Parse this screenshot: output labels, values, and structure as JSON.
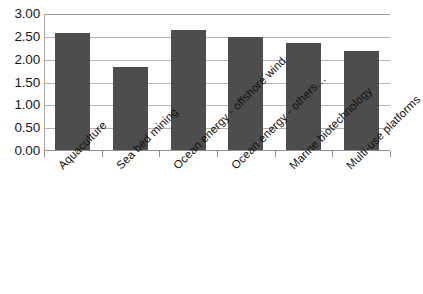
{
  "chart_data": {
    "type": "bar",
    "title": "",
    "subtitle": "",
    "xlabel": "",
    "ylabel": "",
    "categories": [
      "Aquaculture",
      "Sea bed mining",
      "Ocean energy - offshore wind",
      "Ocean energy - others…",
      "Marine biotechnology",
      "Multi-use platforms"
    ],
    "values": [
      2.56,
      1.82,
      2.63,
      2.47,
      2.35,
      2.17
    ],
    "series": [
      {
        "name": "",
        "values": [
          2.56,
          1.82,
          2.63,
          2.47,
          2.35,
          2.17
        ]
      }
    ],
    "ylim": [
      0.0,
      3.0
    ],
    "ytick_values": [
      0.0,
      0.5,
      1.0,
      1.5,
      2.0,
      2.5,
      3.0
    ],
    "ytick_labels": [
      "0.00",
      "0.50",
      "1.00",
      "1.50",
      "2.00",
      "2.50",
      "3.00"
    ],
    "grid": true,
    "grid_axis": "y",
    "legend": false,
    "legend_position": "none",
    "bar_color": "#4d4d4d",
    "grid_color": "#b3b3b3",
    "axis_color": "#8f8f8f",
    "background_color": "#ffffff",
    "text_color": "#111111",
    "xtick_label_rotation": -45
  }
}
